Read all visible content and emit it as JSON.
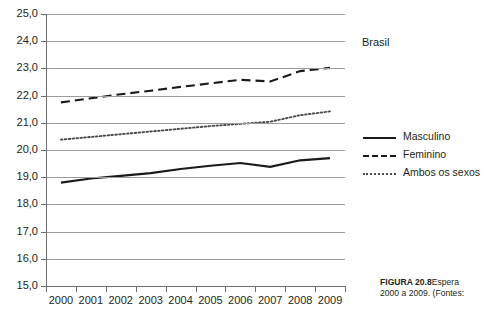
{
  "chart_data": {
    "type": "line",
    "title": "",
    "subtitle": "",
    "annotation": "Brasil",
    "xlabel": "",
    "ylabel": "",
    "x": [
      2000,
      2001,
      2002,
      2003,
      2004,
      2005,
      2006,
      2007,
      2008,
      2009
    ],
    "categories": [
      "2000",
      "2001",
      "2002",
      "2003",
      "2004",
      "2005",
      "2006",
      "2007",
      "2008",
      "2009"
    ],
    "ylim": [
      15.0,
      25.0
    ],
    "ystep": 1.0,
    "ytick_labels": [
      "25,0",
      "24,0",
      "23,0",
      "22,0",
      "21,0",
      "20,0",
      "19,0",
      "18,0",
      "17,0",
      "16,0",
      "15,0"
    ],
    "ytick_values": [
      25.0,
      24.0,
      23.0,
      22.0,
      21.0,
      20.0,
      19.0,
      18.0,
      17.0,
      16.0,
      15.0
    ],
    "grid": true,
    "grid_orientation": "horizontal",
    "legend_position": "right",
    "series": [
      {
        "name": "Masculino",
        "style": "solid",
        "color": "#1a1a1a",
        "values": [
          18.8,
          18.95,
          19.05,
          19.15,
          19.3,
          19.42,
          19.52,
          19.38,
          19.62,
          19.7
        ]
      },
      {
        "name": "Feminino",
        "style": "dashed",
        "color": "#1a1a1a",
        "values": [
          21.75,
          21.9,
          22.05,
          22.18,
          22.32,
          22.45,
          22.58,
          22.52,
          22.9,
          23.02
        ]
      },
      {
        "name": "Ambos os sexos",
        "style": "dotted",
        "color": "#4a4a4a",
        "values": [
          20.38,
          20.48,
          20.58,
          20.68,
          20.78,
          20.88,
          20.96,
          21.04,
          21.28,
          21.42
        ]
      }
    ]
  },
  "legend": {
    "items": [
      {
        "label": "Masculino",
        "style": "solid"
      },
      {
        "label": "Feminino",
        "style": "dashed"
      },
      {
        "label": "Ambos os sexos",
        "style": "dotted"
      }
    ]
  },
  "caption": {
    "figure_number": "FIGURA 20.8",
    "line1_rest": "Espera",
    "line2": "2000 a 2009. (Fontes:"
  }
}
